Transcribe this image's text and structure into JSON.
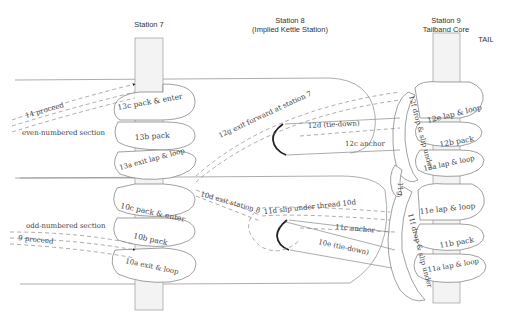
{
  "headers": {
    "station7": "Station 7",
    "station8_line1": "Station 8",
    "station8_line2": "(Implied Kettle Station)",
    "station9_line1": "Station 9",
    "station9_line2": "Tailband Core",
    "tail": "TAIL"
  },
  "sections": {
    "even": "even-numbered section",
    "odd": "odd-numbered section"
  },
  "labels": {
    "s14": "14 proceed",
    "s13c": "13c pack & enter",
    "s13b": "13b pack",
    "s13a": "13a exit lap & loop",
    "s12g": "12g exit forward at station 7",
    "s12d": "12d (tie-down)",
    "s12c": "12c anchor",
    "s12f": "12f drop & slip under",
    "s12e": "12e lap & loop",
    "s12b": "12b pack",
    "s12a": "12a lap & loop",
    "s11g": "11g",
    "s11f": "11f drop & slip under",
    "s11e": "11e lap & loop",
    "s11b": "11b pack",
    "s11a": "11a lap & loop",
    "s11d": "11d slip under thread 10d",
    "s11c": "11c anchor",
    "s10e": "10e (tie-down)",
    "s10d": "10d exit station 8",
    "s10c": "10c pack & enter",
    "s10b": "10b pack",
    "s10a": "10a exit & loop",
    "s9": "9 proceed"
  },
  "colors": {
    "line": "#8a8a8a",
    "pole_fill": "#f3f3f3",
    "text": "#444444",
    "kettle_arc": "#222222"
  }
}
